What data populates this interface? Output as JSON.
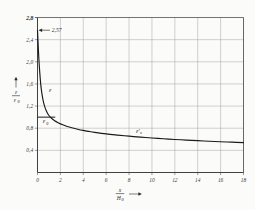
{
  "chart_data": {
    "type": "line",
    "title": "",
    "xlabel": "x / H0",
    "ylabel": "e / e0",
    "xlim": [
      0,
      18
    ],
    "ylim": [
      0,
      2.8
    ],
    "grid": true,
    "legend": "none",
    "x_ticks": [
      "0",
      "2",
      "4",
      "6",
      "8",
      "10",
      "12",
      "14",
      "16",
      "18"
    ],
    "x_tick_values": [
      0,
      2,
      4,
      6,
      8,
      10,
      12,
      14,
      16,
      18
    ],
    "y_ticks": [
      "0,4",
      "0,8",
      "1,2",
      "1,6",
      "2,0",
      "2,4",
      "2,8"
    ],
    "y_tick_values": [
      0.4,
      0.8,
      1.2,
      1.6,
      2.0,
      2.4,
      2.8
    ],
    "annotations": [
      {
        "text": "2,57",
        "x": 0.0,
        "y": 2.57,
        "kind": "arrow-callout"
      }
    ],
    "series": [
      {
        "name": "e",
        "label": "ε",
        "label_x": 1.0,
        "label_y": 1.45,
        "x": [
          0.0,
          0.06,
          0.12,
          0.2,
          0.3,
          0.42,
          0.55,
          0.7,
          0.85,
          1.0,
          1.2,
          1.5,
          1.8,
          2.2,
          2.6,
          3.0,
          3.5,
          4.0,
          4.5,
          5.0,
          6.0,
          7.0,
          8.0,
          9.0,
          10.0,
          11.0,
          12.0,
          13.0,
          14.0,
          15.0,
          16.0,
          17.0,
          18.0
        ],
        "values": [
          2.57,
          2.3,
          2.05,
          1.8,
          1.56,
          1.38,
          1.25,
          1.15,
          1.08,
          1.03,
          0.985,
          0.935,
          0.9,
          0.862,
          0.832,
          0.808,
          0.782,
          0.76,
          0.742,
          0.726,
          0.698,
          0.676,
          0.656,
          0.639,
          0.624,
          0.61,
          0.597,
          0.586,
          0.575,
          0.565,
          0.556,
          0.548,
          0.54
        ]
      },
      {
        "name": "e0",
        "label": "ε",
        "sublabel": "0",
        "label_x": 0.45,
        "label_y": 0.89,
        "kind": "horizontal-reference",
        "x": [
          0.0,
          1.55
        ],
        "values": [
          1.0,
          1.0
        ]
      },
      {
        "name": "ex-prime",
        "label": "ε'",
        "sublabel": "x",
        "label_x": 8.6,
        "label_y": 0.72,
        "kind": "branch-label"
      }
    ],
    "colors": {
      "curve": "#1a1a1a",
      "grid": "#9a9a9a",
      "axis": "#3a3a3a",
      "background": "#fbfbfa",
      "text": "#2b2b2b"
    }
  },
  "axes": {
    "y_axis_numerator": "ε",
    "y_axis_denominator": "ε",
    "y_axis_denominator_sub": "0",
    "x_axis_numerator": "x",
    "x_axis_denominator": "H",
    "x_axis_denominator_sub": "0",
    "x_arrow": "→",
    "y_arrow": "↑"
  }
}
